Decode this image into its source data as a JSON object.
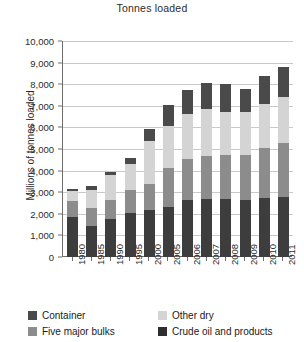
{
  "chart_data": {
    "type": "bar",
    "stacked": true,
    "title": "Tonnes loaded",
    "xlabel": "",
    "ylabel": "Millions of tonnes loaded",
    "ylim": [
      0,
      10000
    ],
    "ytick_labels": [
      "0",
      "1,000",
      "2,000",
      "3,000",
      "4,000",
      "5,000",
      "6,000",
      "7,000",
      "8,000",
      "9,000",
      "10,000"
    ],
    "ytick_values": [
      0,
      1000,
      2000,
      3000,
      4000,
      5000,
      6000,
      7000,
      8000,
      9000,
      10000
    ],
    "grid": true,
    "legend_position": "bottom",
    "categories": [
      "1980",
      "1985",
      "1990",
      "1995",
      "2000",
      "2005",
      "2006",
      "2007",
      "2008",
      "2009",
      "2010",
      "2011"
    ],
    "series": [
      {
        "name": "Crude oil and products",
        "color": "#3d3d3d",
        "values": [
          1870,
          1450,
          1760,
          2050,
          2160,
          2330,
          2660,
          2680,
          2700,
          2620,
          2750,
          2800
        ]
      },
      {
        "name": "Five major bulks",
        "color": "#8c8c8c",
        "values": [
          730,
          810,
          880,
          1050,
          1240,
          1780,
          1860,
          1980,
          2030,
          2110,
          2310,
          2500
        ]
      },
      {
        "name": "Other dry",
        "color": "#d4d4d4",
        "values": [
          440,
          850,
          1150,
          1200,
          1990,
          1950,
          2120,
          2200,
          2000,
          1970,
          2030,
          2100
        ]
      },
      {
        "name": "Container",
        "color": "#4a4a4a",
        "values": [
          100,
          190,
          140,
          270,
          520,
          960,
          1100,
          1180,
          1270,
          1100,
          1270,
          1400
        ]
      }
    ],
    "totals": [
      3140,
      3300,
      3930,
      4570,
      5910,
      7020,
      7740,
      8040,
      8000,
      7800,
      8360,
      8800
    ]
  },
  "legend": {
    "entries": [
      {
        "label": "Container",
        "color": "#4a4a4a"
      },
      {
        "label": "Other dry",
        "color": "#d4d4d4"
      },
      {
        "label": "Five major bulks",
        "color": "#8c8c8c"
      },
      {
        "label": "Crude oil and products",
        "color": "#2e2e2e"
      }
    ]
  },
  "colors": {
    "grid": "#c9c9c9",
    "axis": "#6e6e6e",
    "background": "#ffffff",
    "text": "#1a1a1a"
  }
}
